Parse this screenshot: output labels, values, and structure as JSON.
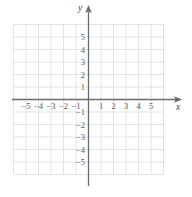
{
  "figure": {
    "kind": "cartesian-coordinate-grid",
    "background_color": "#ffffff"
  },
  "axes": {
    "x_axis_label": "x",
    "y_axis_label": "y",
    "axis_color": "#6b6b6b",
    "grid_color": "#e2e2e6",
    "label_color": "#5a5a5a",
    "origin_label": ""
  },
  "chart_data": {
    "type": "scatter",
    "title": "",
    "subtitle": "",
    "xlabel": "x",
    "ylabel": "y",
    "xlim": [
      -6,
      6
    ],
    "ylim": [
      -6,
      6
    ],
    "grid": true,
    "grid_step": 1,
    "legend": "none",
    "series": [
      {
        "name": "",
        "x": [],
        "y": []
      }
    ],
    "annotations": [],
    "x_ticks": [
      -5,
      -4,
      -3,
      -2,
      -1,
      1,
      2,
      3,
      4,
      5
    ],
    "y_ticks": [
      -5,
      -4,
      -3,
      -2,
      -1,
      1,
      2,
      3,
      4,
      5
    ],
    "x_tick_labels": [
      "−5",
      "−4",
      "−3",
      "−2",
      "−1",
      "1",
      "2",
      "3",
      "4",
      "5"
    ],
    "y_tick_labels": [
      "−5",
      "−4",
      "−3",
      "−2",
      "−1",
      "1",
      "2",
      "3",
      "4",
      "5"
    ]
  }
}
